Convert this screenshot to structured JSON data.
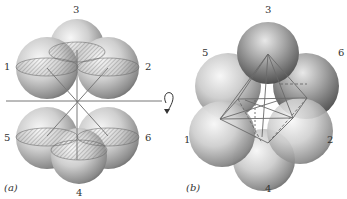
{
  "figure": {
    "panels": [
      {
        "id": "a",
        "caption": "(a)",
        "sphere_labels": {
          "s1": "1",
          "s2": "2",
          "s3": "3",
          "s4": "4",
          "s5": "5",
          "s6": "6"
        },
        "annotations": [
          "horizontal rotation axis",
          "curved rotation arrow"
        ]
      },
      {
        "id": "b",
        "caption": "(b)",
        "sphere_labels": {
          "s1": "1",
          "s2": "2",
          "s3": "3",
          "s4": "4",
          "s5": "5",
          "s6": "6"
        },
        "annotations": [
          "inscribed octahedron wireframe"
        ]
      }
    ],
    "colors": {
      "sphere_light": "#f2f2f2",
      "sphere_mid": "#b8b8b8",
      "sphere_dark": "#5a5a5a",
      "line": "#777777"
    }
  }
}
